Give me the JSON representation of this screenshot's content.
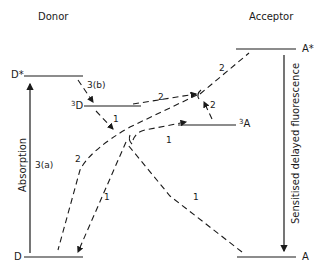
{
  "diagram": {
    "headings": {
      "donor": "Donor",
      "acceptor": "Acceptor"
    },
    "levels": {
      "d_star": "D*",
      "d_triplet_sup": "3",
      "d_triplet": "D",
      "d_ground": "D",
      "a_star": "A*",
      "a_triplet_sup": "3",
      "a_triplet": "A",
      "a_ground": "A"
    },
    "arrow_labels": {
      "absorption": "Absorption",
      "step_3a": "3(a)",
      "step_3b": "3(b)",
      "fluorescence": "Sensitised delayed fluorescence",
      "path1_a": "1",
      "path1_b": "1",
      "path1_c": "1",
      "path2_a": "2",
      "path2_b": "2",
      "path2_c": "2",
      "path2_d": "2"
    },
    "colors": {
      "line": "#1a1a1a",
      "background": "#ffffff"
    }
  }
}
